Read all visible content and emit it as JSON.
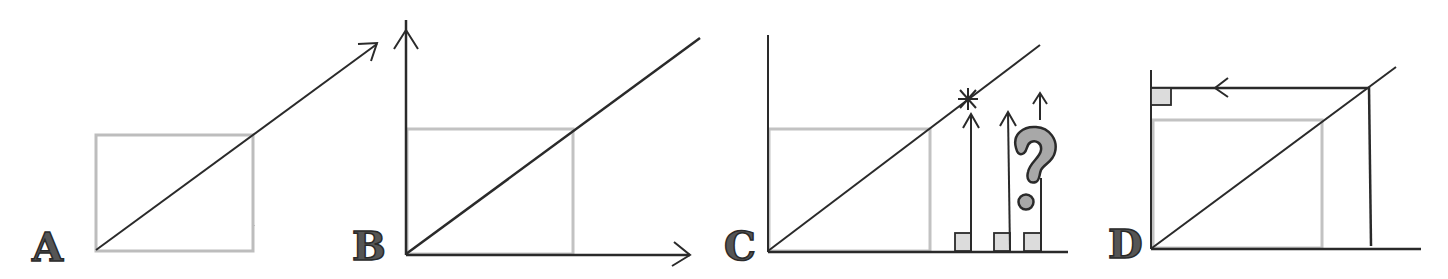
{
  "diagram": {
    "colors": {
      "ink": "#2a2a2a",
      "pencil": "#bdbdbd",
      "fill_gray": "#a8a8a8",
      "fill_light": "#dcdcdc"
    },
    "panels": [
      {
        "id": "A",
        "label": "A",
        "description": "Diagonal arrow rising from bottom-left corner of a light pencil square, extending beyond its top-right corner"
      },
      {
        "id": "B",
        "label": "B",
        "description": "Axes added: vertical and horizontal arrows; diagonal line through square corner"
      },
      {
        "id": "C",
        "label": "C",
        "description": "Vertical arrows rising from points on the horizontal axis; first reaches the diagonal at a star mark; question mark beside third",
        "annotations": [
          "star-mark",
          "question-mark",
          "right-angle-markers"
        ]
      },
      {
        "id": "D",
        "label": "D",
        "description": "Vertical line up to diagonal, then horizontal arrow pointing left to vertical axis with a right-angle marker"
      }
    ]
  }
}
